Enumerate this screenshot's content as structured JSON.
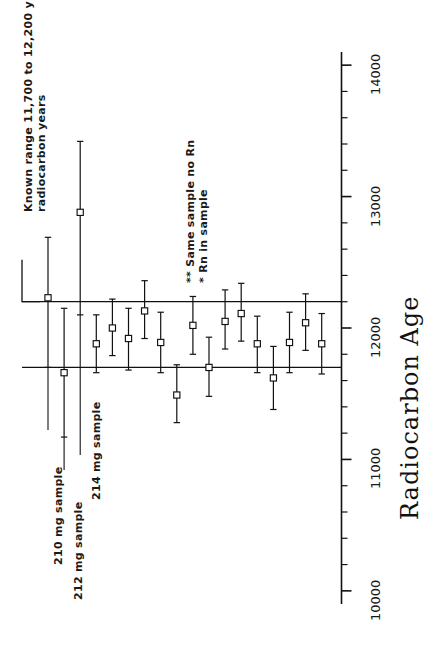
{
  "chart_data": {
    "type": "scatter",
    "title": "",
    "orientation": "rotated-90ccw",
    "xlabel": "",
    "ylabel": "Radiocarbon Age",
    "axis_title": "Radiocarbon Age",
    "axis_ticks_major": [
      10000,
      11000,
      12000,
      13000,
      14000
    ],
    "axis_tick_labels": [
      "10000",
      "11000",
      "12000",
      "13000",
      "14000"
    ],
    "axis_minor_tick_interval": 200,
    "axis_range": [
      9900,
      14100
    ],
    "grid": false,
    "legend_position": "inside-upper-right",
    "reference_band": {
      "label": "Known range 11,700 to 12,200 ybp radiocarbon years",
      "lower": 11700,
      "upper": 12200
    },
    "marker": "open-square",
    "error_bar_cap": "plus-tick",
    "series": [
      {
        "name": "Radiocarbon measurements",
        "points": [
          {
            "index": 1,
            "value": 12230,
            "err_low": 11700,
            "err_high": 12690,
            "flag": "",
            "label": "210 mg sample"
          },
          {
            "index": 2,
            "value": 11660,
            "err_low": 11170,
            "err_high": 12150,
            "flag": "",
            "label": "212 mg sample"
          },
          {
            "index": 3,
            "value": 12880,
            "err_low": 12100,
            "err_high": 13420,
            "flag": "",
            "label": "214 mg sample"
          },
          {
            "index": 4,
            "value": 11880,
            "err_low": 11660,
            "err_high": 12100,
            "flag": ""
          },
          {
            "index": 5,
            "value": 12000,
            "err_low": 11790,
            "err_high": 12220,
            "flag": ""
          },
          {
            "index": 6,
            "value": 11920,
            "err_low": 11680,
            "err_high": 12150,
            "flag": ""
          },
          {
            "index": 7,
            "value": 12130,
            "err_low": 11920,
            "err_high": 12360,
            "flag": "**"
          },
          {
            "index": 8,
            "value": 11890,
            "err_low": 11660,
            "err_high": 12120,
            "flag": "**"
          },
          {
            "index": 9,
            "value": 11490,
            "err_low": 11280,
            "err_high": 11720,
            "flag": "*"
          },
          {
            "index": 10,
            "value": 12020,
            "err_low": 11800,
            "err_high": 12240,
            "flag": ""
          },
          {
            "index": 11,
            "value": 11700,
            "err_low": 11480,
            "err_high": 11930,
            "flag": ""
          },
          {
            "index": 12,
            "value": 12050,
            "err_low": 11840,
            "err_high": 12290,
            "flag": ""
          },
          {
            "index": 13,
            "value": 12110,
            "err_low": 11900,
            "err_high": 12340,
            "flag": ""
          },
          {
            "index": 14,
            "value": 11880,
            "err_low": 11660,
            "err_high": 12090,
            "flag": ""
          },
          {
            "index": 15,
            "value": 11620,
            "err_low": 11380,
            "err_high": 11860,
            "flag": ""
          },
          {
            "index": 16,
            "value": 11890,
            "err_low": 11660,
            "err_high": 12120,
            "flag": ""
          },
          {
            "index": 17,
            "value": 12040,
            "err_low": 11830,
            "err_high": 12260,
            "flag": ""
          },
          {
            "index": 18,
            "value": 11880,
            "err_low": 11650,
            "err_high": 12110,
            "flag": ""
          }
        ]
      }
    ],
    "annotations": [
      {
        "name": "known-range-note",
        "text": "Known range 11,700 to 12,200 ybp"
      },
      {
        "name": "known-range-note-2",
        "text": "radiocarbon years"
      },
      {
        "name": "sample-label-210",
        "text": "210 mg sample"
      },
      {
        "name": "sample-label-212",
        "text": "212 mg sample"
      },
      {
        "name": "sample-label-214",
        "text": "214 mg sample"
      }
    ],
    "legend_entries": [
      {
        "marker": "**",
        "text": "Same sample no Rn"
      },
      {
        "marker": "*",
        "text": "Rn in sample"
      }
    ]
  },
  "axis": {
    "title": "Radiocarbon Age",
    "tick_labels": [
      "10000",
      "11000",
      "12000",
      "13000",
      "14000"
    ]
  },
  "notes": {
    "known_range_line1": "Known range 11,700 to 12,200 ybp",
    "known_range_line2": "radiocarbon years"
  },
  "legend": {
    "entry1": "** Same sample no Rn",
    "entry2": "* Rn in sample",
    "entry1_marker": "**",
    "entry1_text": "Same sample no Rn",
    "entry2_marker": "*",
    "entry2_text": "Rn in sample"
  },
  "sample_labels": {
    "s210": "210 mg sample",
    "s212": "212 mg sample",
    "s214": "214 mg sample"
  },
  "colors": {
    "ink": "#111111",
    "background": "#ffffff"
  }
}
